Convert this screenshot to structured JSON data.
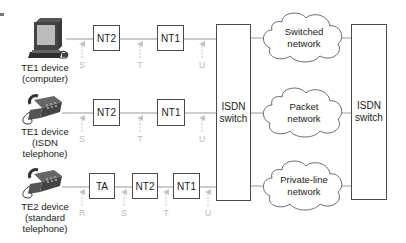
{
  "rows": [
    {
      "device_label": [
        "TE1 device",
        "(computer)"
      ],
      "boxes": [
        "NT2",
        "NT1"
      ],
      "refs": [
        "S",
        "T",
        "U"
      ]
    },
    {
      "device_label": [
        "TE1 device",
        "(ISDN",
        "telephone)"
      ],
      "boxes": [
        "NT2",
        "NT1"
      ],
      "refs": [
        "S",
        "T",
        "U"
      ]
    },
    {
      "device_label": [
        "TE2 device",
        "(standard",
        "telephone)"
      ],
      "boxes": [
        "TA",
        "NT2",
        "NT1"
      ],
      "refs": [
        "R",
        "S",
        "T",
        "U"
      ]
    }
  ],
  "switches": [
    {
      "line1": "ISDN",
      "line2": "switch"
    },
    {
      "line1": "ISDN",
      "line2": "switch"
    }
  ],
  "clouds": [
    {
      "line1": "Switched",
      "line2": "network"
    },
    {
      "line1": "Packet",
      "line2": "network"
    },
    {
      "line1": "Private-line",
      "line2": "network"
    }
  ],
  "colors": {
    "line": "#9a9a9a",
    "box_border": "#4a4a4a",
    "ref_label": "#b9b9b9"
  }
}
